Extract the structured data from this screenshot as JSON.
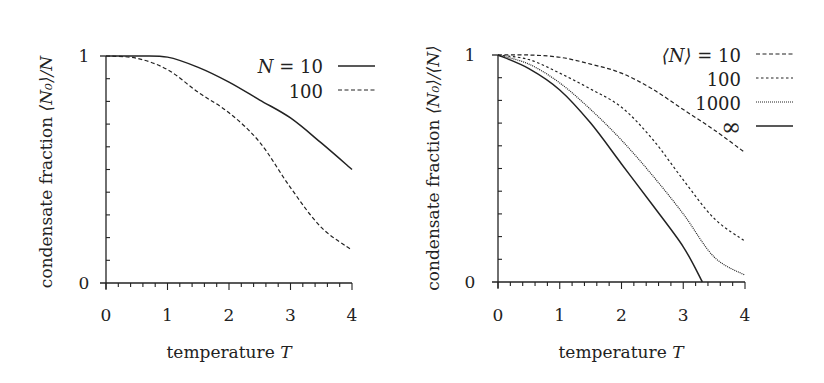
{
  "chart_data": [
    {
      "type": "line",
      "title": "",
      "xlabel": "temperature T",
      "ylabel": "condensate fraction ⟨N₀⟩/N",
      "xlim": [
        0,
        4
      ],
      "ylim": [
        0,
        1
      ],
      "xticks": [
        0,
        1,
        2,
        3,
        4
      ],
      "yticks": [
        0,
        1
      ],
      "x_minor_step": 0.2,
      "y_minor_step": 0.1,
      "grid": false,
      "legend_position": "upper right",
      "series": [
        {
          "name": "N = 10",
          "style": "solid",
          "x": [
            0,
            0.5,
            1.0,
            1.5,
            2.0,
            2.5,
            3.0,
            3.5,
            4.0
          ],
          "y": [
            1.0,
            1.0,
            0.995,
            0.95,
            0.885,
            0.806,
            0.727,
            0.617,
            0.5
          ]
        },
        {
          "name": "100",
          "style": "dashed",
          "x": [
            0,
            0.5,
            1.0,
            1.5,
            2.0,
            2.5,
            3.0,
            3.5,
            4.0
          ],
          "y": [
            1.0,
            0.99,
            0.94,
            0.84,
            0.75,
            0.62,
            0.42,
            0.245,
            0.145
          ]
        }
      ]
    },
    {
      "type": "line",
      "title": "",
      "xlabel": "temperature T",
      "ylabel": "condensate fraction ⟨N₀⟩/⟨N⟩",
      "xlim": [
        0,
        4
      ],
      "ylim": [
        0,
        1
      ],
      "xticks": [
        0,
        1,
        2,
        3,
        4
      ],
      "yticks": [
        0,
        1
      ],
      "x_minor_step": 0.2,
      "y_minor_step": 0.1,
      "grid": false,
      "legend_position": "upper right",
      "series": [
        {
          "name": "⟨N⟩ = 10",
          "style": "dashed",
          "x": [
            0,
            0.5,
            1.0,
            1.5,
            2.0,
            2.5,
            3.0,
            3.5,
            4.0
          ],
          "y": [
            1.0,
            1.0,
            0.99,
            0.96,
            0.92,
            0.85,
            0.76,
            0.67,
            0.57
          ]
        },
        {
          "name": "100",
          "style": "short-dashed",
          "x": [
            0,
            0.5,
            1.0,
            1.5,
            2.0,
            2.5,
            3.0,
            3.5,
            4.0
          ],
          "y": [
            1.0,
            0.98,
            0.92,
            0.85,
            0.77,
            0.63,
            0.45,
            0.28,
            0.18
          ]
        },
        {
          "name": "1000",
          "style": "dotted",
          "x": [
            0,
            0.5,
            1.0,
            1.5,
            2.0,
            2.5,
            3.0,
            3.5,
            4.0
          ],
          "y": [
            1.0,
            0.96,
            0.877,
            0.76,
            0.625,
            0.47,
            0.3,
            0.11,
            0.03
          ]
        },
        {
          "name": "∞",
          "style": "solid",
          "x": [
            0,
            0.5,
            1.0,
            1.5,
            2.0,
            2.5,
            3.0,
            3.31
          ],
          "y": [
            1.0,
            0.94,
            0.846,
            0.7,
            0.52,
            0.34,
            0.155,
            0.0
          ]
        }
      ]
    }
  ],
  "panels": [
    {
      "ylabel_prefix": "condensate fraction ",
      "ylabel_math": "⟨N₀⟩/N",
      "xlabel_prefix": "temperature ",
      "xlabel_math": "T",
      "tick_labels_x": [
        "0",
        "1",
        "2",
        "3",
        "4"
      ],
      "tick_labels_y": [
        "0",
        "1"
      ],
      "legend": [
        {
          "math": "N",
          "rest": " = 10"
        },
        {
          "math": "",
          "rest": "100"
        }
      ]
    },
    {
      "ylabel_prefix": "condensate fraction ",
      "ylabel_math": "⟨N₀⟩/⟨N⟩",
      "xlabel_prefix": "temperature ",
      "xlabel_math": "T",
      "tick_labels_x": [
        "0",
        "1",
        "2",
        "3",
        "4"
      ],
      "tick_labels_y": [
        "0",
        "1"
      ],
      "legend": [
        {
          "math": "⟨N⟩",
          "rest": " = 10"
        },
        {
          "math": "",
          "rest": "100"
        },
        {
          "math": "",
          "rest": "1000"
        },
        {
          "math": "",
          "rest": "∞"
        }
      ]
    }
  ],
  "colors": {
    "ink": "#222222",
    "background": "#ffffff"
  }
}
